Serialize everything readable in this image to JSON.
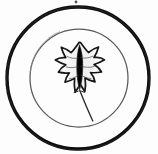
{
  "image": {
    "title": "Circular leaf emblem",
    "description": "Scanned monochrome botanical emblem: a lobed leaf centered inside two concentric circles",
    "width": 158,
    "height": 154,
    "background_color": "#fdfdfd",
    "ink_color": "#111111",
    "midtone_color": "#5a5a5a",
    "faint_color": "#8e8e8e"
  },
  "elements": {
    "outer_ring": {
      "name": "outer-circle",
      "center_x": 78,
      "center_y": 78,
      "radius": 71,
      "stroke_width": 3.4,
      "color": "#101010"
    },
    "inner_ring": {
      "name": "inner-circle",
      "center_x": 79,
      "center_y": 78,
      "radius": 49,
      "stroke_width": 1.2,
      "color": "#555555"
    },
    "leaf": {
      "name": "lobed-leaf",
      "lobe_count": 9,
      "center_x": 79,
      "center_y": 75,
      "width": 46,
      "height": 62,
      "outline_color": "#161616",
      "midrib_color": "#0d0d0d",
      "blade_fill": "#fbfbfb",
      "stem": {
        "name": "leaf-stem",
        "from_x": 80,
        "from_y": 104,
        "to_x": 93,
        "to_y": 121,
        "color": "#2a2a2a"
      }
    },
    "speck": {
      "name": "scan-speck",
      "x": 76,
      "y": 2,
      "radius": 1.4,
      "color": "#3a3a3a"
    }
  }
}
